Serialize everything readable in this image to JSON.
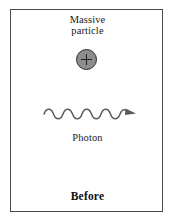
{
  "figure": {
    "frame": {
      "border_color": "#4a4a4a",
      "background": "#ffffff"
    },
    "massive_particle": {
      "caption_line_1": "Massive",
      "caption_line_2": "particle",
      "charge_symbol": "+",
      "fill_color": "#8d8d8d",
      "stroke_color": "#2b2b2b"
    },
    "photon": {
      "label": "Photon",
      "wave_color": "#5a5a5a",
      "cycles": 4.5,
      "direction": "right"
    },
    "state_caption": "Before"
  }
}
